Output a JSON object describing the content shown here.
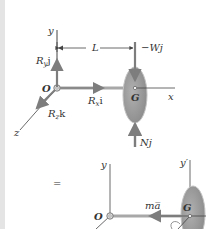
{
  "figure": {
    "top_diagram": {
      "axes": {
        "y": "y",
        "x": "x",
        "z": "z",
        "origin": "O"
      },
      "dimension": "L",
      "forces": {
        "weight": "−Wj",
        "normal": "Nj",
        "reaction_y": {
          "base": "R",
          "sub": "y",
          "vec": "j"
        },
        "reaction_x": {
          "base": "R",
          "sub": "x",
          "vec": "i"
        },
        "reaction_z": {
          "base": "R",
          "sub": "z",
          "vec": "k"
        }
      },
      "center_label": "G"
    },
    "equals": "=",
    "bottom_diagram": {
      "axes": {
        "y": "y",
        "y_prime": "y′",
        "origin": "O"
      },
      "inertia_vector": "ma̅",
      "center_label": "G"
    },
    "colors": {
      "axis": "#444444",
      "force_arrow": "#8a8a8a",
      "disk_fill": "#9a9a9a",
      "disk_edge": "#bdbdbd",
      "shaft": "#a8a8a8",
      "stripe": "#e4e4e4"
    }
  }
}
